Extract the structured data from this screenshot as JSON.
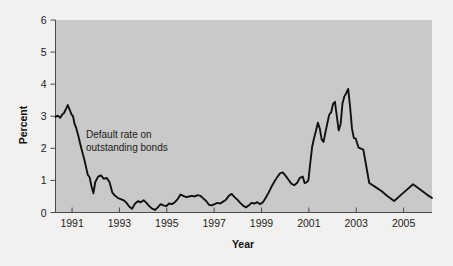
{
  "chart_data": {
    "type": "line",
    "title": "",
    "xlabel": "Year",
    "ylabel": "Percent",
    "xlim": [
      1990.3,
      2006.2
    ],
    "ylim": [
      0,
      6
    ],
    "grid": false,
    "legend_position": "none",
    "annotations": [
      {
        "name": "series-annotation",
        "line1": "Default rate on",
        "line2": "outstanding bonds",
        "x": 1991.3,
        "y": 2.35
      }
    ],
    "xticks": [
      1991,
      1993,
      1995,
      1997,
      1999,
      2001,
      2003,
      2005
    ],
    "xticklabels": [
      "1991",
      "1993",
      "1995",
      "1997",
      "1999",
      "2001",
      "2003",
      "2005"
    ],
    "yticks": [
      0,
      1,
      2,
      3,
      4,
      5,
      6
    ],
    "yticklabels": [
      "0",
      "1",
      "2",
      "3",
      "4",
      "5",
      "6"
    ],
    "colors": {
      "plot_background": "#c9c9c9",
      "figure_background": "#f2f1ef",
      "line": "#111111",
      "axis": "#4a4a4a",
      "text": "#1c1c1c"
    },
    "series": [
      {
        "name": "Default rate on outstanding bonds",
        "x": [
          1990.3,
          1990.4,
          1990.5,
          1990.58,
          1990.66,
          1990.74,
          1990.82,
          1990.9,
          1990.98,
          1991.04,
          1991.1,
          1991.18,
          1991.26,
          1991.34,
          1991.42,
          1991.5,
          1991.58,
          1991.66,
          1991.74,
          1991.82,
          1991.9,
          1991.98,
          1992.1,
          1992.22,
          1992.34,
          1992.46,
          1992.58,
          1992.7,
          1992.82,
          1992.94,
          1993.06,
          1993.18,
          1993.3,
          1993.42,
          1993.54,
          1993.66,
          1993.78,
          1993.9,
          1994.02,
          1994.14,
          1994.26,
          1994.38,
          1994.5,
          1994.62,
          1994.74,
          1994.86,
          1994.98,
          1995.1,
          1995.22,
          1995.34,
          1995.46,
          1995.58,
          1995.7,
          1995.82,
          1995.94,
          1996.06,
          1996.18,
          1996.3,
          1996.42,
          1996.54,
          1996.66,
          1996.78,
          1996.9,
          1997.02,
          1997.14,
          1997.26,
          1997.38,
          1997.5,
          1997.62,
          1997.74,
          1997.86,
          1997.98,
          1998.1,
          1998.22,
          1998.34,
          1998.46,
          1998.58,
          1998.7,
          1998.82,
          1998.94,
          1999.06,
          1999.18,
          1999.3,
          1999.42,
          1999.54,
          1999.66,
          1999.78,
          1999.9,
          2000.02,
          2000.14,
          2000.26,
          2000.38,
          2000.5,
          2000.62,
          2000.74,
          2000.82,
          2000.9,
          2000.98,
          2001.06,
          2001.14,
          2001.22,
          2001.3,
          2001.38,
          2001.46,
          2001.54,
          2001.62,
          2001.7,
          2001.78,
          2001.86,
          2001.94,
          2002.02,
          2002.1,
          2002.18,
          2002.26,
          2002.34,
          2002.42,
          2002.5,
          2002.58,
          2002.66,
          2002.74,
          2002.82,
          2002.9,
          2002.98,
          2003.1,
          2003.3,
          2003.55,
          2003.8,
          2004.05,
          2004.3,
          2004.6,
          2005.0,
          2005.4,
          2005.7,
          2006.0,
          2006.2
        ],
        "values": [
          2.98,
          3.02,
          2.95,
          3.05,
          3.1,
          3.22,
          3.35,
          3.2,
          3.05,
          3.0,
          2.78,
          2.62,
          2.4,
          2.15,
          1.92,
          1.7,
          1.45,
          1.18,
          1.1,
          0.82,
          0.6,
          0.95,
          1.12,
          1.16,
          1.05,
          1.08,
          0.95,
          0.62,
          0.52,
          0.45,
          0.42,
          0.38,
          0.3,
          0.18,
          0.12,
          0.28,
          0.35,
          0.32,
          0.38,
          0.3,
          0.2,
          0.12,
          0.08,
          0.16,
          0.26,
          0.22,
          0.2,
          0.28,
          0.26,
          0.32,
          0.42,
          0.56,
          0.52,
          0.48,
          0.5,
          0.52,
          0.5,
          0.54,
          0.52,
          0.44,
          0.36,
          0.24,
          0.22,
          0.26,
          0.3,
          0.28,
          0.34,
          0.4,
          0.52,
          0.58,
          0.48,
          0.4,
          0.3,
          0.22,
          0.16,
          0.22,
          0.3,
          0.28,
          0.32,
          0.26,
          0.32,
          0.46,
          0.62,
          0.8,
          0.96,
          1.1,
          1.22,
          1.25,
          1.14,
          1.02,
          0.9,
          0.85,
          0.92,
          1.08,
          1.12,
          0.92,
          0.94,
          1.0,
          1.55,
          2.05,
          2.32,
          2.55,
          2.8,
          2.62,
          2.28,
          2.2,
          2.5,
          2.78,
          3.05,
          3.12,
          3.38,
          3.45,
          3.0,
          2.56,
          2.75,
          3.4,
          3.62,
          3.72,
          3.85,
          3.3,
          2.62,
          2.32,
          2.3,
          2.02,
          1.96,
          0.92,
          0.8,
          0.68,
          0.52,
          0.36,
          0.62,
          0.88,
          0.72,
          0.55,
          0.45
        ]
      }
    ]
  },
  "figure": {
    "caption": ""
  }
}
